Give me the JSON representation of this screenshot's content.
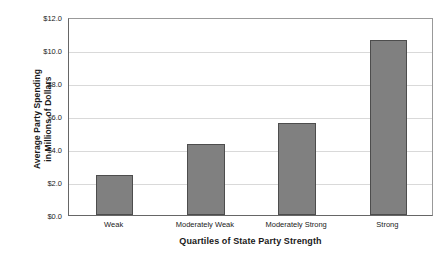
{
  "chart_data": {
    "type": "bar",
    "title": "",
    "subtitle": "",
    "xlabel": "Quartiles of State Party Strength",
    "ylabel": "Average Party Spending in Millions of Dollars",
    "ylabel_lines": [
      "Average Party Spending",
      "in Millions of Dollars"
    ],
    "categories": [
      "Weak",
      "Moderately Weak",
      "Moderately Strong",
      "Strong"
    ],
    "values": [
      2.4,
      4.3,
      5.6,
      10.6
    ],
    "ylim": [
      0,
      12
    ],
    "ytick_values": [
      0,
      2,
      4,
      6,
      8,
      10,
      12
    ],
    "ytick_labels": [
      "$0.0",
      "$2.0",
      "$4.0",
      "$6.0",
      "$8.0",
      "$10.0",
      "$12.0"
    ],
    "grid": true,
    "grid_axis": "y",
    "legend": false,
    "legend_position": "none",
    "bar_color": "#808080",
    "bar_edge_color": "#4d4d4d",
    "grid_color": "#d9d9d9",
    "axis_color": "#666666",
    "background_color": "#ffffff",
    "text_color": "#1a1a1a"
  }
}
